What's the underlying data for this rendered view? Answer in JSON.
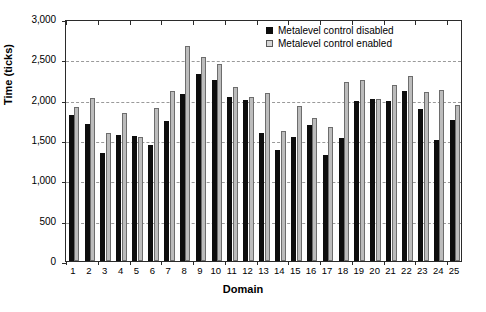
{
  "chart_data": {
    "type": "bar",
    "title": "",
    "xlabel": "Domain",
    "ylabel": "Time (ticks)",
    "categories": [
      "1",
      "2",
      "3",
      "4",
      "5",
      "6",
      "7",
      "8",
      "9",
      "10",
      "11",
      "12",
      "13",
      "14",
      "15",
      "16",
      "17",
      "18",
      "19",
      "20",
      "21",
      "22",
      "23",
      "24",
      "25"
    ],
    "ylim": [
      0,
      3000
    ],
    "yticks": [
      0,
      500,
      1000,
      1500,
      2000,
      2500,
      3000
    ],
    "ytick_labels": [
      "0",
      "500",
      "1,000",
      "1,500",
      "2,000",
      "2,500",
      "3,000"
    ],
    "grid": true,
    "legend_position": "top-right",
    "series": [
      {
        "name": "Metalevel control disabled",
        "color": "#0d0d0d",
        "values": [
          1810,
          1700,
          1340,
          1560,
          1555,
          1440,
          1740,
          2075,
          2320,
          2240,
          2030,
          1990,
          1590,
          1380,
          1535,
          1690,
          1320,
          1520,
          1985,
          2010,
          1980,
          2105,
          1890,
          1500,
          1750
        ]
      },
      {
        "name": "Metalevel control enabled",
        "color": "#bcbcbc",
        "values": [
          1915,
          2025,
          1590,
          1840,
          1535,
          1900,
          2105,
          2670,
          2525,
          2440,
          2155,
          2030,
          2080,
          1615,
          1925,
          1775,
          1660,
          2215,
          2245,
          2005,
          2185,
          2295,
          2100,
          2120,
          1930
        ]
      }
    ]
  },
  "legend": {
    "items": [
      {
        "label": "Metalevel control disabled",
        "swatch": "dark"
      },
      {
        "label": "Metalevel control enabled",
        "swatch": "light"
      }
    ]
  }
}
